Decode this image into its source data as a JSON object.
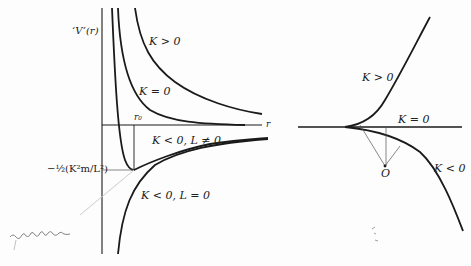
{
  "left_panel": {
    "y_axis_label": "‘V’(r)",
    "x_axis_label": "r",
    "r0_label": "r₀",
    "min_label": "−½(K²m/L²)",
    "curves": [
      {
        "id": "k-positive",
        "label": "K > 0"
      },
      {
        "id": "k-zero",
        "label": "K = 0"
      },
      {
        "id": "k-neg-l-nonzero",
        "label": "K < 0, L ≠ 0"
      },
      {
        "id": "k-neg-l-zero",
        "label": "K < 0, L = 0"
      }
    ],
    "handwritten_note": "equilibrium"
  },
  "right_panel": {
    "curves": [
      {
        "id": "k-positive",
        "label": "K > 0"
      },
      {
        "id": "k-zero",
        "label": "K = 0"
      },
      {
        "id": "k-negative",
        "label": "K < 0"
      }
    ],
    "center_label": "O"
  },
  "colors": {
    "ink": "#1a1a1a",
    "thin": "#555555",
    "paper": "#fdfdfd"
  }
}
